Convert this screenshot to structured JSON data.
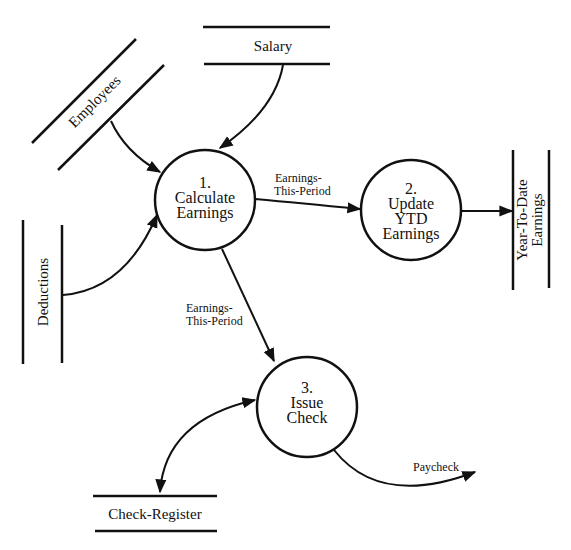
{
  "diagram": {
    "type": "data-flow-diagram",
    "processes": [
      {
        "id": "p1",
        "number": "1.",
        "line1": "Calculate",
        "line2": "Earnings",
        "line3": ""
      },
      {
        "id": "p2",
        "number": "2.",
        "line1": "Update",
        "line2": "YTD",
        "line3": "Earnings"
      },
      {
        "id": "p3",
        "number": "3.",
        "line1": "Issue",
        "line2": "Check",
        "line3": ""
      }
    ],
    "stores": {
      "employees": "Employees",
      "salary": "Salary",
      "deductions": "Deductions",
      "ytd_line1": "Year-To-Date",
      "ytd_line2": "Earnings",
      "check_register": "Check-Register"
    },
    "flows": {
      "p1_to_p2_line1": "Earnings-",
      "p1_to_p2_line2": "This-Period",
      "p1_to_p3_line1": "Earnings-",
      "p1_to_p3_line2": "This-Period",
      "paycheck": "Paycheck"
    },
    "colors": {
      "ink": "#111111",
      "background": "#ffffff"
    }
  }
}
